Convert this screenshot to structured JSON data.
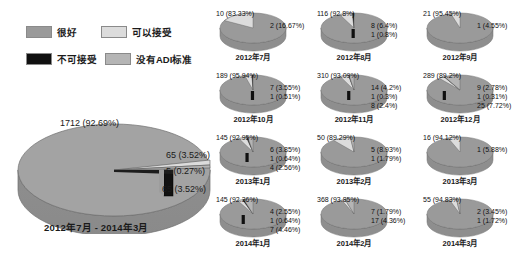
{
  "legend": {
    "items": [
      {
        "label": "很好",
        "color": "#9a9a9a",
        "key": "good"
      },
      {
        "label": "可以接受",
        "color": "#dcdcdc",
        "key": "acceptable"
      },
      {
        "label": "不可接受",
        "color": "#101010",
        "key": "unacceptable"
      },
      {
        "label": "没有ADI标准",
        "color": "#b5b5b5",
        "key": "no-adi"
      }
    ]
  },
  "main_chart": {
    "title": "2012年7月 - 2014年3月",
    "labels": {
      "good": "1712 (92.69%)",
      "acceptable": "65 (3.52%)",
      "unacceptable": "5 (0.27%)",
      "no_adi": "65 (3.52%)"
    }
  },
  "chart_data": {
    "type": "pie",
    "legend_position": "top-left",
    "categories": [
      "很好",
      "可以接受",
      "不可接受",
      "没有ADI标准"
    ],
    "colors": [
      "#9a9a9a",
      "#dcdcdc",
      "#101010",
      "#b5b5b5"
    ],
    "main": {
      "label": "2012年7月 - 2014年3月",
      "values": [
        1712,
        65,
        5,
        65
      ],
      "percents": [
        92.69,
        3.52,
        0.27,
        3.52
      ],
      "total": 1847
    },
    "panels": [
      {
        "label": "2012年7月",
        "values": [
          10,
          2,
          0,
          0
        ],
        "percents": [
          83.33,
          16.67,
          0,
          0
        ],
        "labels": [
          "10 (83.33%)",
          "2 (16.67%)"
        ]
      },
      {
        "label": "2012年8月",
        "values": [
          116,
          8,
          1,
          0
        ],
        "percents": [
          92.8,
          6.4,
          0.8,
          0
        ],
        "labels": [
          "116 (92.8%)",
          "8 (6.4%)",
          "1 (0.8%)"
        ]
      },
      {
        "label": "2012年9月",
        "values": [
          21,
          1,
          0,
          0
        ],
        "percents": [
          95.45,
          4.55,
          0,
          0
        ],
        "labels": [
          "21 (95.45%)",
          "1 (4.55%)"
        ]
      },
      {
        "label": "2012年10月",
        "values": [
          189,
          7,
          1,
          0
        ],
        "percents": [
          95.94,
          3.55,
          0.51,
          0
        ],
        "labels": [
          "189 (95.94%)",
          "7 (3.55%)",
          "1 (0.51%)"
        ]
      },
      {
        "label": "2012年11月",
        "values": [
          310,
          14,
          1,
          8
        ],
        "percents": [
          93.09,
          4.2,
          0.3,
          2.4
        ],
        "labels": [
          "310 (93.09%)",
          "14 (4.2%)",
          "1 (0.3%)",
          "8 (2.4%)"
        ]
      },
      {
        "label": "2012年12月",
        "values": [
          289,
          9,
          1,
          25
        ],
        "percents": [
          89.2,
          2.78,
          0.31,
          7.72
        ],
        "labels": [
          "289 (89.2%)",
          "9 (2.78%)",
          "1 (0.31%)",
          "25 (7.72%)"
        ]
      },
      {
        "label": "2013年1月",
        "values": [
          145,
          6,
          1,
          4
        ],
        "percents": [
          92.95,
          3.85,
          0.64,
          2.56
        ],
        "labels": [
          "145 (92.95%)",
          "6 (3.85%)",
          "1 (0.64%)",
          "4 (2.56%)"
        ]
      },
      {
        "label": "2013年2月",
        "values": [
          50,
          5,
          0,
          1
        ],
        "percents": [
          89.29,
          8.93,
          0,
          1.79
        ],
        "labels": [
          "50 (89.29%)",
          "5 (8.93%)",
          "1 (1.79%)"
        ]
      },
      {
        "label": "2013年3月",
        "values": [
          16,
          1,
          0,
          0
        ],
        "percents": [
          94.12,
          5.88,
          0,
          0
        ],
        "labels": [
          "16 (94.12%)",
          "1 (5.88%)"
        ]
      },
      {
        "label": "2014年1月",
        "values": [
          145,
          4,
          1,
          7
        ],
        "percents": [
          92.36,
          2.55,
          0.64,
          4.46
        ],
        "labels": [
          "145 (92.36%)",
          "4 (2.55%)",
          "1 (0.64%)",
          "7 (4.46%)"
        ]
      },
      {
        "label": "2014年2月",
        "values": [
          368,
          7,
          0,
          17
        ],
        "percents": [
          93.85,
          1.79,
          0,
          4.36
        ],
        "labels": [
          "368 (93.85%)",
          "7 (1.79%)",
          "17 (4.36%)"
        ]
      },
      {
        "label": "2014年3月",
        "values": [
          55,
          2,
          0,
          1
        ],
        "percents": [
          94.83,
          3.45,
          0,
          1.72
        ],
        "labels": [
          "55 (94.83%)",
          "2 (3.45%)",
          "1 (1.72%)"
        ]
      }
    ]
  }
}
